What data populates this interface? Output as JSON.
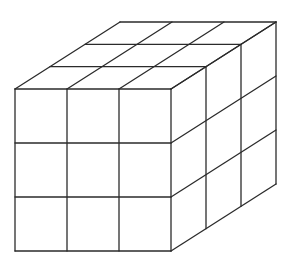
{
  "diagram": {
    "title": "",
    "dimensions": {
      "width_cubes": 3,
      "height_cubes": 3,
      "depth_cubes": 3
    },
    "visible_faces": [
      "front",
      "top",
      "right"
    ],
    "line_color": "#2b2b2b",
    "background_color": "#ffffff"
  }
}
